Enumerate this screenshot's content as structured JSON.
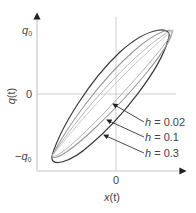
{
  "figure": {
    "y_axis": {
      "label_var": "q",
      "label_arg": "(t)",
      "ticks": [
        "q0",
        "0",
        "-q0"
      ],
      "tick_q0_main": "q",
      "tick_q0_sub": "0",
      "tick_neg_prefix": "−"
    },
    "x_axis": {
      "label_var": "x",
      "label_arg": "(t)",
      "ticks": [
        "0"
      ],
      "tick_zero": "0"
    },
    "annotations": [
      {
        "var": "h",
        "eq": " = ",
        "value": "0.02"
      },
      {
        "var": "h",
        "eq": " = ",
        "value": "0.1"
      },
      {
        "var": "h",
        "eq": " = ",
        "value": "0.3"
      }
    ],
    "colors": {
      "axis": "#c8c8c8",
      "curve_dark": "#3a3a3a",
      "curve_light": "#a8a8a8",
      "text": "#444444"
    }
  }
}
